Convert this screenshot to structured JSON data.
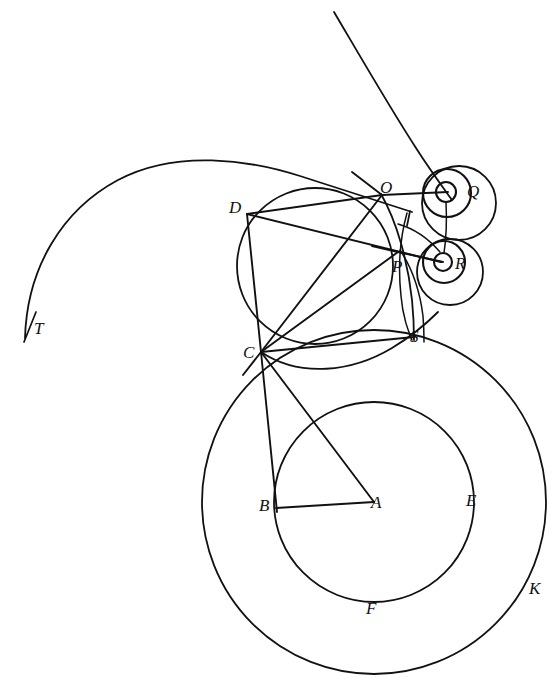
{
  "figure": {
    "kind": "geometry-construction-diagram",
    "background_color": "#ffffff",
    "ink_color": "#111111",
    "width": 559,
    "height": 697
  },
  "labels": {
    "A": "A",
    "B": "B",
    "C": "C",
    "D": "D",
    "E": "E",
    "F": "F",
    "K": "K",
    "O": "O",
    "P": "P",
    "Q": "Q",
    "R": "R",
    "S": "S",
    "T": "T"
  },
  "points": {
    "A": {
      "label": "A",
      "x": 374,
      "y": 502,
      "label_x": 371,
      "label_y": 494
    },
    "B": {
      "label": "B",
      "x": 275,
      "y": 505,
      "label_x": 259,
      "label_y": 497
    },
    "C": {
      "label": "C",
      "x": 261,
      "y": 352,
      "label_x": 243,
      "label_y": 344
    },
    "D": {
      "label": "D",
      "x": 247,
      "y": 214,
      "label_x": 229,
      "label_y": 199
    },
    "E": {
      "label": "E",
      "x": 474,
      "y": 500,
      "label_x": 466,
      "label_y": 492
    },
    "F": {
      "label": "F",
      "x": 374,
      "y": 597,
      "label_x": 366,
      "label_y": 600
    },
    "K": {
      "label": "K",
      "x": 534,
      "y": 578,
      "label_x": 529,
      "label_y": 580
    },
    "O": {
      "label": "O",
      "x": 382,
      "y": 195,
      "label_x": 380,
      "label_y": 179
    },
    "P": {
      "label": "P",
      "x": 398,
      "y": 252,
      "label_x": 392,
      "label_y": 258
    },
    "Q": {
      "label": "Q",
      "x": 460,
      "y": 192,
      "label_x": 467,
      "label_y": 183
    },
    "R": {
      "label": "R",
      "x": 450,
      "y": 263,
      "label_x": 455,
      "label_y": 255
    },
    "S": {
      "label": "S",
      "x": 414,
      "y": 335,
      "label_x": 410,
      "label_y": 328
    },
    "T": {
      "label": "T",
      "x": 30,
      "y": 326,
      "label_x": 34,
      "label_y": 320
    }
  },
  "circles": {
    "outer_K": {
      "name": "outer-circle-K",
      "cx": 374,
      "cy": 502,
      "r": 172
    },
    "inner_BEF": {
      "name": "inner-circle-BEF",
      "cx": 374,
      "cy": 502,
      "r": 100
    },
    "main_DOC": {
      "name": "circle-through-D-O-C",
      "cx": 315,
      "cy": 266,
      "r": 78
    },
    "Q_large": {
      "name": "circle-Q-large",
      "cx": 459,
      "cy": 203,
      "r": 37
    },
    "Q_mid": {
      "name": "circle-Q-mid",
      "cx": 447,
      "cy": 193,
      "r": 24
    },
    "Q_small": {
      "name": "circle-Q-small",
      "cx": 446,
      "cy": 192,
      "r": 10
    },
    "R_large": {
      "name": "circle-R-large",
      "cx": 450,
      "cy": 272,
      "r": 33
    },
    "R_mid": {
      "name": "circle-R-mid",
      "cx": 444,
      "cy": 262,
      "r": 21
    },
    "R_small": {
      "name": "circle-R-small",
      "cx": 443,
      "cy": 262,
      "r": 9
    }
  },
  "segments": [
    {
      "name": "segment-D-O",
      "from": "D",
      "to": "O"
    },
    {
      "name": "segment-D-C",
      "from": "D",
      "to": "C"
    },
    {
      "name": "segment-D-P",
      "from": "D",
      "to": "P"
    },
    {
      "name": "segment-O-C",
      "from": "O",
      "to": "C"
    },
    {
      "name": "segment-C-P",
      "from": "C",
      "to": "P"
    },
    {
      "name": "segment-C-S",
      "from": "C",
      "to": "S"
    },
    {
      "name": "segment-C-B",
      "from": "C",
      "to": "B"
    },
    {
      "name": "segment-C-A",
      "from": "C",
      "to": "A"
    },
    {
      "name": "segment-B-A",
      "from": "B",
      "to": "A"
    },
    {
      "name": "segment-O-Q",
      "from": "O",
      "to": "Q"
    },
    {
      "name": "segment-P-R",
      "from": "P",
      "to": "R"
    }
  ],
  "curves": {
    "spiral_T": "spiral-arc-ending-at-T",
    "upper_descending": "descending-curve-to-Q",
    "arc_O_S": "arc-from-O-through-S",
    "arc_P_S": "arc-from-P-to-S",
    "arc_C_S_lower": "lower-arc-C-to-S"
  }
}
